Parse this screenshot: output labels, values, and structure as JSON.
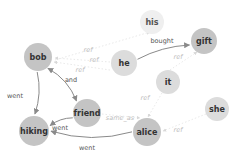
{
  "diagram": {
    "type": "coreference-graph",
    "nodes": [
      {
        "id": "bob",
        "label": "bob",
        "emphasis": "strong"
      },
      {
        "id": "his",
        "label": "his",
        "emphasis": "faint"
      },
      {
        "id": "he",
        "label": "he",
        "emphasis": "medium"
      },
      {
        "id": "gift",
        "label": "gift",
        "emphasis": "strong"
      },
      {
        "id": "it",
        "label": "it",
        "emphasis": "medium"
      },
      {
        "id": "she",
        "label": "she",
        "emphasis": "medium"
      },
      {
        "id": "friend",
        "label": "friend",
        "emphasis": "strong"
      },
      {
        "id": "hiking",
        "label": "hiking",
        "emphasis": "strong"
      },
      {
        "id": "alice",
        "label": "alice",
        "emphasis": "strong"
      }
    ],
    "edges": [
      {
        "source": "bob",
        "target": "hiking",
        "label": "went",
        "style": "solid"
      },
      {
        "source": "bob",
        "target": "friend",
        "label": "and",
        "style": "solid",
        "bidirectional": true
      },
      {
        "source": "friend",
        "target": "hiking",
        "label": "went",
        "style": "solid"
      },
      {
        "source": "alice",
        "target": "hiking",
        "label": "went",
        "style": "solid"
      },
      {
        "source": "he",
        "target": "gift",
        "label": "bought",
        "style": "solid"
      },
      {
        "source": "his",
        "target": "bob",
        "label": "ref",
        "style": "faint"
      },
      {
        "source": "he",
        "target": "bob",
        "label": "ref",
        "style": "faint"
      },
      {
        "source": "he",
        "target": "bob",
        "label": "ref",
        "style": "faint"
      },
      {
        "source": "it",
        "target": "gift",
        "label": "ref",
        "style": "faint"
      },
      {
        "source": "she",
        "target": "alice",
        "label": "ref",
        "style": "faint"
      },
      {
        "source": "friend",
        "target": "alice",
        "label": "same_as",
        "style": "faint"
      },
      {
        "source": "it",
        "target": "alice",
        "label": "ref",
        "style": "faint"
      }
    ],
    "colors": {
      "strong_node": "#c4c4c4",
      "medium_node": "#dcdcdc",
      "faint_node": "#efefef",
      "solid_edge": "#8a8a8a",
      "faint_edge": "#d8d8d8",
      "strong_text": "#333333",
      "faint_text": "#bdbdbd"
    }
  }
}
